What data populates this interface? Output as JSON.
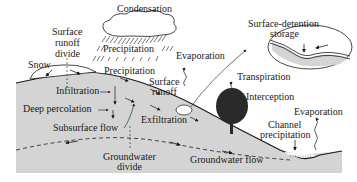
{
  "diagram": {
    "colors": {
      "ground": "#d4d4d4",
      "line": "#1a1a1a",
      "cloud": "#ffffff",
      "tree": "#2a2a2a",
      "background": "#ffffff"
    },
    "labels": {
      "condensation": "Condensation",
      "surface_runoff_divide_1": "Surface",
      "surface_runoff_divide_2": "runoff",
      "surface_runoff_divide_3": "divide",
      "precipitation_rain": "Precipitation",
      "precipitation_ground": "Precipitation",
      "snow": "Snow",
      "evaporation_top": "Evaporation",
      "surface_detention_1": "Surface-detention",
      "surface_detention_2": "storage",
      "transpiration": "Transpiration",
      "surface_runoff_1": "Surface",
      "surface_runoff_2": "runoff",
      "infiltration": "Infiltration",
      "deep_percolation": "Deep percolation",
      "interception": "Interception",
      "exfiltration": "Exfiltration",
      "subsurface_flow": "Subsurface flow",
      "evaporation_channel": "Evaporation",
      "channel_precipitation_1": "Channel",
      "channel_precipitation_2": "precipitation",
      "groundwater_divide_1": "Groundwater",
      "groundwater_divide_2": "divide",
      "groundwater_flow": "Groundwater flow"
    }
  }
}
